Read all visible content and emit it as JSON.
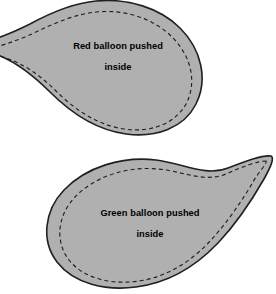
{
  "figure": {
    "background_color": "#ffffff",
    "fill_color": "#b0b0b0",
    "outline_color": "#231f20",
    "dashed_color": "#231f20",
    "text_color": "#000000"
  },
  "balloons": [
    {
      "id": "red-balloon",
      "label_line1": "Red balloon pushed",
      "label_line2": "inside",
      "orientation": "neck-upper-left",
      "label_x": 118,
      "label_y1": 49,
      "label_y2": 70
    },
    {
      "id": "green-balloon",
      "label_line1": "Green balloon pushed",
      "label_line2": "inside",
      "orientation": "neck-upper-right",
      "label_x": 150,
      "label_y1": 216,
      "label_y2": 237
    }
  ]
}
